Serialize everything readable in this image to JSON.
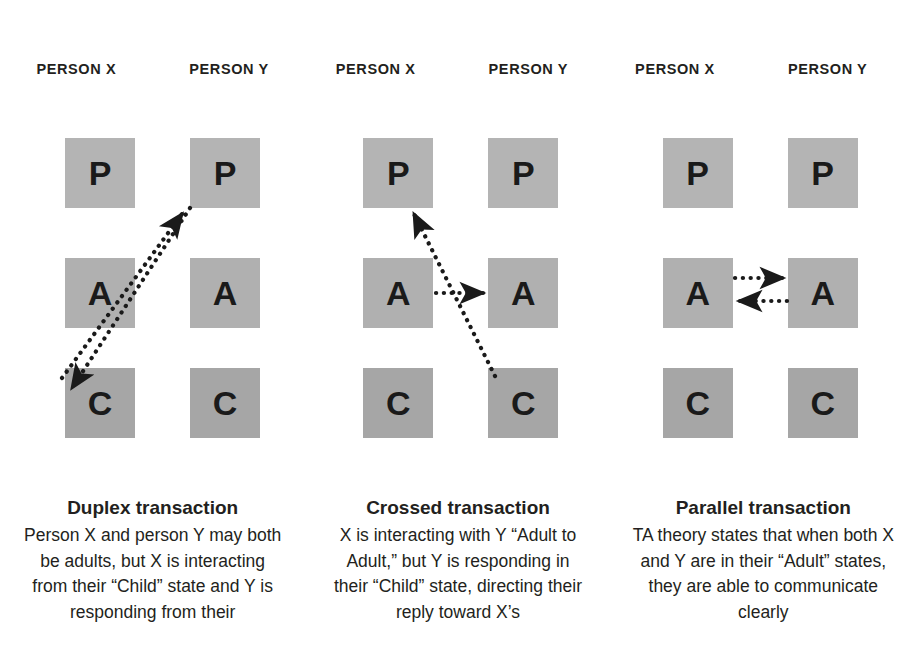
{
  "colors": {
    "background": "#ffffff",
    "box_parent": "#b4b4b4",
    "box_adult": "#b0b0b0",
    "box_child": "#a6a6a6",
    "text": "#231f20",
    "arrow": "#1a1a1a"
  },
  "person_headers": {
    "x": "PERSON X",
    "y": "PERSON Y"
  },
  "ego_states": {
    "parent": "P",
    "adult": "A",
    "child": "C"
  },
  "panels": [
    {
      "id": "duplex",
      "header_x": "PERSON X",
      "header_y": "PERSON Y",
      "boxes": {
        "x_parent": "P",
        "x_adult": "A",
        "x_child": "C",
        "y_parent": "P",
        "y_adult": "A",
        "y_child": "C"
      },
      "arrows": [
        {
          "name": "child-x-to-parent-y",
          "from": "X Child",
          "to": "Y Parent",
          "style": "dotted",
          "direction": "up-right"
        },
        {
          "name": "parent-y-to-child-x",
          "from": "Y Parent",
          "to": "X Child",
          "style": "dotted",
          "direction": "down-left"
        }
      ],
      "caption_title": "Duplex transaction",
      "caption_body": "Person X and person Y may both be adults, but X is interacting from their “Child” state and Y is responding from their"
    },
    {
      "id": "crossed",
      "header_x": "PERSON X",
      "header_y": "PERSON Y",
      "boxes": {
        "x_parent": "P",
        "x_adult": "A",
        "x_child": "C",
        "y_parent": "P",
        "y_adult": "A",
        "y_child": "C"
      },
      "arrows": [
        {
          "name": "adult-x-to-adult-y",
          "from": "X Adult",
          "to": "Y Adult",
          "style": "dotted",
          "direction": "right"
        },
        {
          "name": "child-y-to-parent-x",
          "from": "Y Child",
          "to": "X Parent",
          "style": "dotted",
          "direction": "up-left"
        }
      ],
      "caption_title": "Crossed transaction",
      "caption_body": "X is interacting with Y “Adult to Adult,” but Y is responding in their “Child” state, directing their reply toward X’s"
    },
    {
      "id": "parallel",
      "header_x": "PERSON X",
      "header_y": "PERSON Y",
      "boxes": {
        "x_parent": "P",
        "x_adult": "A",
        "x_child": "C",
        "y_parent": "P",
        "y_adult": "A",
        "y_child": "C"
      },
      "arrows": [
        {
          "name": "adult-x-to-adult-y",
          "from": "X Adult",
          "to": "Y Adult",
          "style": "dotted",
          "direction": "right"
        },
        {
          "name": "adult-y-to-adult-x",
          "from": "Y Adult",
          "to": "X Adult",
          "style": "dotted",
          "direction": "left"
        }
      ],
      "caption_title": "Parallel transaction",
      "caption_body": "TA theory states that when both X and Y are in their “Adult” states, they are able to communicate clearly"
    }
  ]
}
